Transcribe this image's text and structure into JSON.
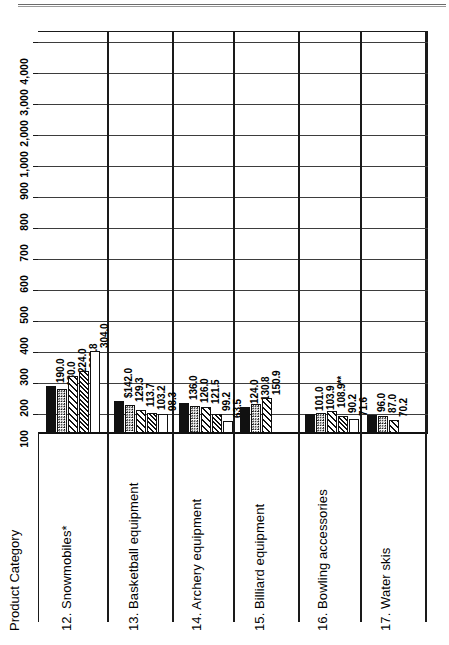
{
  "chart_data": {
    "type": "bar",
    "orientation": "horizontal-rotated",
    "title": "",
    "xlabel": "Product Category",
    "ylabel": "",
    "axis_scale": "log-like piecewise",
    "grid": true,
    "legend_position": "none",
    "tick_labels": [
      "100",
      "200",
      "300",
      "400",
      "500",
      "600",
      "700",
      "800",
      "900",
      "1,000",
      "2,000",
      "3,000",
      "4,000"
    ],
    "tick_values": [
      100,
      200,
      300,
      400,
      500,
      600,
      700,
      800,
      900,
      1000,
      2000,
      3000,
      4000
    ],
    "categories": [
      "12. Snowmobiles*",
      "13. Basketball equipment",
      "14. Archery equipment",
      "15. Billiard equipment",
      "16. Bowling accessories",
      "17. Water skis"
    ],
    "groups": [
      {
        "category": "12. Snowmobiles*",
        "bars": [
          {
            "label": "190.0",
            "value": 190.0,
            "pattern": "solid"
          },
          {
            "label": "180.0",
            "value": 180.0,
            "pattern": "dots"
          },
          {
            "label": "224.0",
            "value": 224.0,
            "pattern": "hatch-coarse"
          },
          {
            "label": "239.8",
            "value": 239.8,
            "pattern": "hatch-dense"
          },
          {
            "label": "304.0",
            "value": 304.0,
            "pattern": "empty"
          }
        ]
      },
      {
        "category": "13. Basketball equipment",
        "bars": [
          {
            "label": "$142.0",
            "value": 142.0,
            "pattern": "solid"
          },
          {
            "label": "129.3",
            "value": 129.3,
            "pattern": "dots"
          },
          {
            "label": "113.7",
            "value": 113.7,
            "pattern": "hatch-coarse"
          },
          {
            "label": "103.2",
            "value": 103.2,
            "pattern": "hatch-dense"
          },
          {
            "label": "98.3",
            "value": 98.3,
            "pattern": "empty"
          }
        ]
      },
      {
        "category": "14. Archery equipment",
        "bars": [
          {
            "label": "136.0",
            "value": 136.0,
            "pattern": "solid"
          },
          {
            "label": "126.0",
            "value": 126.0,
            "pattern": "dots"
          },
          {
            "label": "121.5",
            "value": 121.5,
            "pattern": "hatch-coarse"
          },
          {
            "label": "99.2",
            "value": 99.2,
            "pattern": "hatch-dense"
          },
          {
            "label": "63.5",
            "value": 63.5,
            "pattern": "empty"
          }
        ]
      },
      {
        "category": "15. Billiard equipment",
        "bars": [
          {
            "label": "124.0",
            "value": 124.0,
            "pattern": "solid"
          },
          {
            "label": "130.8",
            "value": 130.8,
            "pattern": "dots"
          },
          {
            "label": "150.9",
            "value": 150.9,
            "pattern": "hatch-coarse"
          }
        ]
      },
      {
        "category": "16. Bowling accessories",
        "bars": [
          {
            "label": "101.0",
            "value": 101.0,
            "pattern": "solid"
          },
          {
            "label": "103.9",
            "value": 103.9,
            "pattern": "dots"
          },
          {
            "label": "108.9**",
            "value": 108.9,
            "pattern": "hatch-coarse"
          },
          {
            "label": "90.2",
            "value": 90.2,
            "pattern": "hatch-dense"
          },
          {
            "label": "71.6",
            "value": 71.6,
            "pattern": "empty"
          }
        ]
      },
      {
        "category": "17. Water skis",
        "bars": [
          {
            "label": "96.0",
            "value": 96.0,
            "pattern": "solid"
          },
          {
            "label": "87.0",
            "value": 87.0,
            "pattern": "dots"
          },
          {
            "label": "70.2",
            "value": 70.2,
            "pattern": "hatch-coarse"
          }
        ]
      }
    ]
  },
  "axis": {
    "category_axis_title": "Product Category"
  }
}
